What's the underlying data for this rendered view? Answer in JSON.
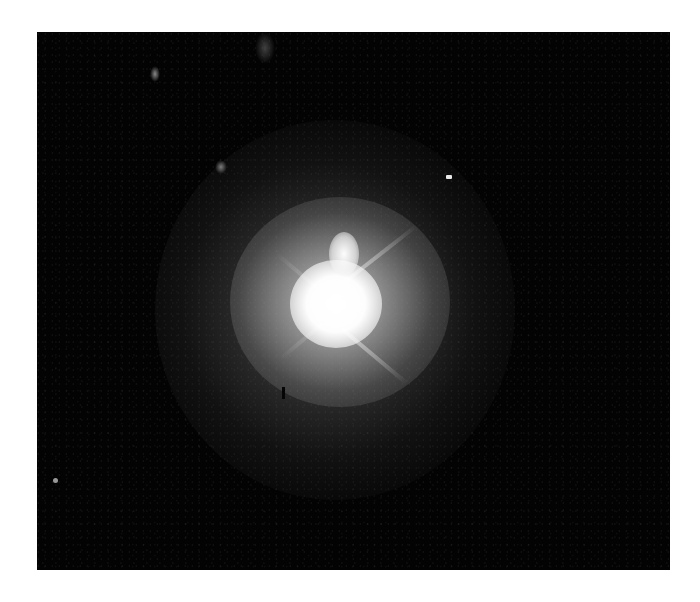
{
  "image": {
    "subject": "astronomical photograph of a bright point source with diffraction spikes and extended halo",
    "background_color": "#ffffff",
    "frame_color": "#030303",
    "core_color": "#ffffff",
    "halo_color": "#8c8c8c",
    "features": [
      {
        "name": "bright-core",
        "description": "saturated central source"
      },
      {
        "name": "core-blob",
        "description": "secondary bright knot above core"
      },
      {
        "name": "diffraction-spike-upper-right",
        "description": "spike toward upper right"
      },
      {
        "name": "diffraction-spike-lower-right",
        "description": "spike toward lower right"
      },
      {
        "name": "extended-halo",
        "description": "diffuse gray nebulosity around core"
      },
      {
        "name": "field-star-right",
        "description": "small bright point to upper right"
      },
      {
        "name": "faint-source-upper-left",
        "description": "faint smudge upper left"
      },
      {
        "name": "faint-source-upper-middle",
        "description": "faint smudge upper middle"
      },
      {
        "name": "faint-source-top",
        "description": "faint smear at top edge"
      },
      {
        "name": "faint-source-lower-left",
        "description": "tiny point lower left"
      },
      {
        "name": "dark-artifact",
        "description": "small dark vertical mark below-left of core"
      }
    ]
  }
}
